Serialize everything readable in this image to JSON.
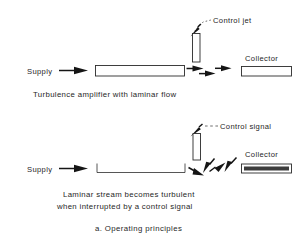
{
  "figure": {
    "caption": "a. Operating principles",
    "panels": [
      {
        "id": "laminar",
        "supply_label": "Supply",
        "control_label": "Control jet",
        "collector_label": "Collector",
        "caption_line1": "Turbulence amplifier with laminar flow"
      },
      {
        "id": "turbulent",
        "supply_label": "Supply",
        "control_label": "Control signal",
        "collector_label": "Collector",
        "caption_line1": "Laminar stream becomes turbulent",
        "caption_line2": "when interrupted by a control signal"
      }
    ]
  },
  "colors": {
    "ink": "#262626",
    "line": "#2b2b2b",
    "arrow": "#151515",
    "background": "#ffffff"
  }
}
